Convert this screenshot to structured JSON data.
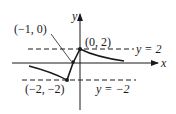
{
  "diagram": {
    "type": "function-graph",
    "axes": {
      "x_label": "x",
      "y_label": "y"
    },
    "asymptotes": [
      {
        "label": "y = 2",
        "var": "y",
        "eq": "=",
        "value": "2"
      },
      {
        "label": "y = −2",
        "var": "y",
        "eq": "=",
        "value": "−2"
      }
    ],
    "points": [
      {
        "label": "(−1, 0)",
        "x": -1,
        "y": 0
      },
      {
        "label": "(0, 2)",
        "x": 0,
        "y": 2
      },
      {
        "label": "(−2, −2)",
        "x": -2,
        "y": -2
      }
    ],
    "colors": {
      "ink": "#1a1a1a",
      "background": "#ffffff"
    }
  }
}
